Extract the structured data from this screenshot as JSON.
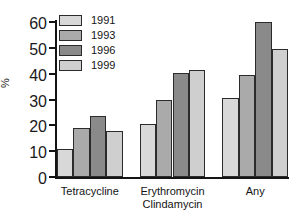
{
  "chart_data": {
    "type": "bar",
    "title": "",
    "subtitle": "",
    "xlabel": "",
    "ylabel": "%",
    "ylim": [
      0,
      60
    ],
    "yticks": [
      0,
      10,
      20,
      30,
      40,
      50,
      60
    ],
    "grid": false,
    "legend_position": "top-left",
    "categories": [
      "Tetracycline",
      "Erythromycin\nClindamycin",
      "Any"
    ],
    "category_lines": [
      [
        "Tetracycline"
      ],
      [
        "Erythromycin",
        "Clindamycin"
      ],
      [
        "Any"
      ]
    ],
    "series": [
      {
        "name": "1991",
        "color": "#d8d8d8",
        "values": [
          11,
          20.5,
          30.5
        ]
      },
      {
        "name": "1993",
        "color": "#aaaaaa",
        "values": [
          18.8,
          29.8,
          39.3
        ]
      },
      {
        "name": "1996",
        "color": "#8a8a8a",
        "values": [
          23.5,
          40.3,
          60
        ]
      },
      {
        "name": "1999",
        "color": "#cfcfcf",
        "values": [
          17.9,
          41.4,
          49.5
        ]
      }
    ]
  },
  "legend": {
    "items": [
      {
        "label": "1991",
        "color": "#d8d8d8"
      },
      {
        "label": "1993",
        "color": "#aaaaaa"
      },
      {
        "label": "1996",
        "color": "#8a8a8a"
      },
      {
        "label": "1999",
        "color": "#cfcfcf"
      }
    ]
  },
  "axis": {
    "y_label": "%",
    "y_tick_labels": [
      "60",
      "50",
      "40",
      "30",
      "20",
      "10",
      "0"
    ]
  },
  "colors": {
    "axis": "#141414",
    "bar_outline": "#2b2b2b",
    "background": "#ffffff"
  }
}
